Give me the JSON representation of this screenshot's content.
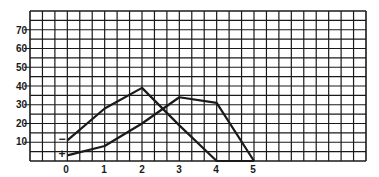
{
  "chart_data": {
    "type": "line",
    "title": "",
    "xlabel": "",
    "ylabel": "",
    "x": [
      0,
      1,
      2,
      3,
      4,
      5
    ],
    "xticks": [
      "0",
      "1",
      "2",
      "3",
      "4",
      "5"
    ],
    "yticks": [
      "10",
      "20",
      "30",
      "40",
      "50",
      "60",
      "70"
    ],
    "xlim": [
      -1,
      8
    ],
    "ylim": [
      0,
      80
    ],
    "grid": true,
    "legend": "none (series marked with '+' and '−' at start)",
    "series": [
      {
        "name": "−",
        "marker": "−",
        "values": [
          11,
          28,
          39,
          19,
          0,
          0
        ]
      },
      {
        "name": "+",
        "marker": "+",
        "values": [
          3,
          8,
          20,
          34,
          31,
          0
        ]
      }
    ]
  },
  "labels": {
    "x": [
      "0",
      "1",
      "2",
      "3",
      "4",
      "5"
    ],
    "y": [
      "10",
      "20",
      "30",
      "40",
      "50",
      "60",
      "70"
    ],
    "minus_marker": "−",
    "plus_marker": "+"
  },
  "colors": {
    "grid": "#1a1a1a",
    "line": "#1a1a1a",
    "background": "#ffffff"
  }
}
